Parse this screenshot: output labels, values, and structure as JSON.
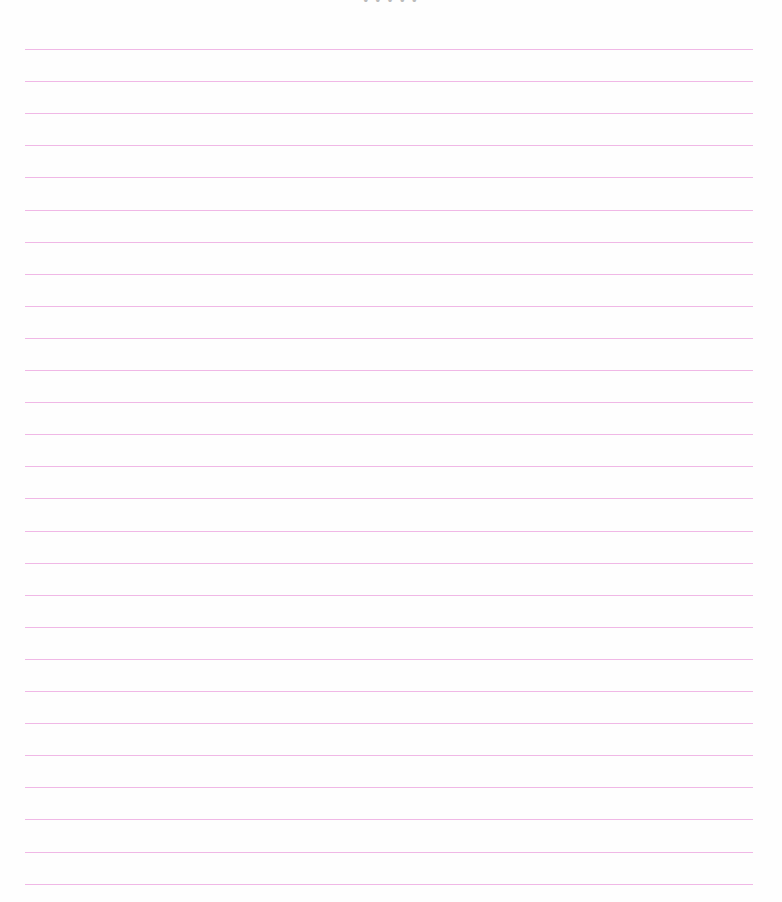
{
  "document": {
    "type": "lined-paper",
    "header_fragment": "• • • • •",
    "rule_count": 27,
    "rule_color": "#f0b8e6",
    "background_color": "#fefefe"
  }
}
